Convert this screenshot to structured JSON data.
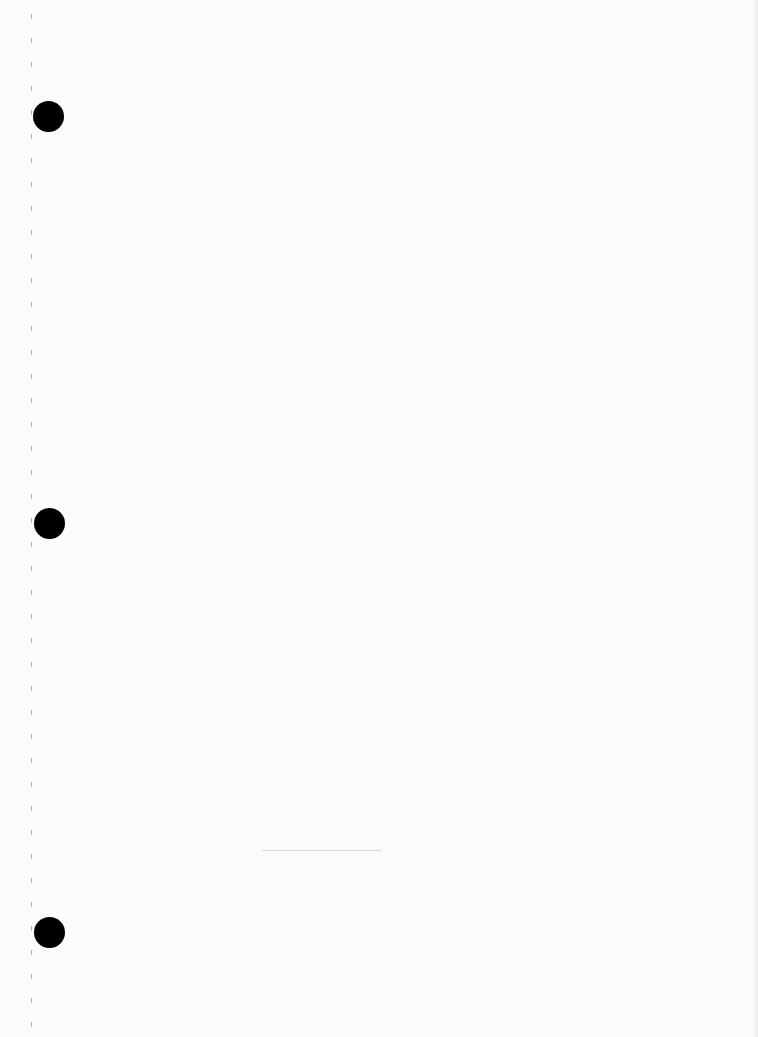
{
  "page": {
    "type": "blank-notebook-page",
    "background_color": "#fbfbfb",
    "holes": [
      {
        "cx": 48,
        "cy": 116,
        "r": 15
      },
      {
        "cx": 49,
        "cy": 523,
        "r": 15
      },
      {
        "cx": 49,
        "cy": 932,
        "r": 15
      }
    ],
    "perforation": {
      "x": 32,
      "start_y": 14,
      "spacing": 24,
      "count": 43,
      "mark_height": 5
    },
    "faint_line": {
      "x1": 262,
      "x2": 381,
      "y": 850
    }
  }
}
